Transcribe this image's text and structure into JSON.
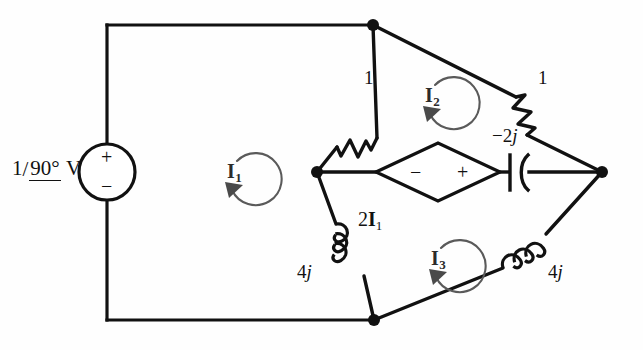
{
  "figure": {
    "type": "circuit-schematic",
    "background_color": "#fefefe",
    "wire_color": "#111111",
    "mesh_arrow_color": "#555555"
  },
  "source": {
    "name": "independent-voltage-source",
    "magnitude": "1",
    "slash": "/",
    "angle": "90°",
    "unit": "V",
    "label_full": "1/90° V",
    "plus_sign": "+",
    "minus_sign": "−"
  },
  "dependent_source": {
    "name": "dependent-voltage-source",
    "label": "2",
    "current_symbol": "I",
    "current_subscript": "1",
    "label_full": "2I1",
    "plus_sign": "+",
    "minus_sign": "−",
    "plus_side": "right",
    "minus_side": "left"
  },
  "components": [
    {
      "id": "r-upper-left",
      "type": "resistor",
      "value": "1",
      "imag": "",
      "position": "upper-left-diagonal"
    },
    {
      "id": "r-upper-right",
      "type": "resistor",
      "value": "1",
      "imag": "",
      "position": "upper-right-diagonal"
    },
    {
      "id": "c-middle",
      "type": "capacitor",
      "value": "−2",
      "imag": "j",
      "position": "middle-right-horizontal"
    },
    {
      "id": "l-lower-left",
      "type": "inductor",
      "value": "4",
      "imag": "j",
      "position": "lower-left-diagonal"
    },
    {
      "id": "l-lower-right",
      "type": "inductor",
      "value": "4",
      "imag": "j",
      "position": "lower-right-diagonal"
    }
  ],
  "mesh_currents": [
    {
      "id": "I1",
      "symbol": "I",
      "subscript": "1",
      "direction": "clockwise"
    },
    {
      "id": "I2",
      "symbol": "I",
      "subscript": "2",
      "direction": "clockwise"
    },
    {
      "id": "I3",
      "symbol": "I",
      "subscript": "3",
      "direction": "clockwise"
    }
  ],
  "nodes": [
    {
      "id": "top-node",
      "x": 373,
      "y": 25
    },
    {
      "id": "left-middle-node",
      "x": 317,
      "y": 172
    },
    {
      "id": "right-middle-node",
      "x": 602,
      "y": 172
    },
    {
      "id": "bottom-node",
      "x": 374,
      "y": 320
    }
  ]
}
